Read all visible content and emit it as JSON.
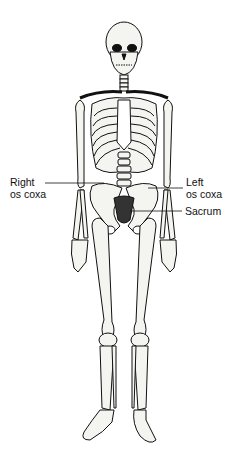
{
  "diagram": {
    "labels": {
      "right_os_coxa": {
        "line1": "Right",
        "line2": "os coxa"
      },
      "left_os_coxa": {
        "line1": "Left",
        "line2": "os coxa"
      },
      "sacrum": "Sacrum"
    },
    "colors": {
      "ink": "#111111",
      "bone": "#f4f4f0",
      "background": "#ffffff"
    }
  }
}
